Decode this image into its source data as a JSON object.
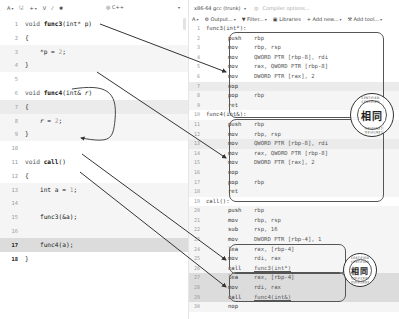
{
  "left_toolbar": {
    "items": [
      {
        "icon": "font-size-icon",
        "label": "A",
        "caret": "▾"
      },
      {
        "icon": "save-icon",
        "label": "🖫"
      },
      {
        "icon": "add-icon",
        "label": "+",
        "caret": "▾"
      },
      {
        "icon": "vim-icon",
        "label": "V"
      },
      {
        "icon": "pen-icon",
        "label": "⁄"
      },
      {
        "icon": "settings-icon",
        "label": "✱"
      }
    ],
    "language": {
      "icon": "cpp-logo-icon",
      "label": "C++",
      "caret": "▾"
    }
  },
  "source": {
    "lines": [
      {
        "n": "1",
        "text": "void func3(int* p)"
      },
      {
        "n": "2",
        "text": "{"
      },
      {
        "n": "3",
        "text": "    *p = 2;"
      },
      {
        "n": "4",
        "text": "}"
      },
      {
        "n": "5",
        "text": ""
      },
      {
        "n": "6",
        "text": "void func4(int& r)"
      },
      {
        "n": "7",
        "text": "{"
      },
      {
        "n": "8",
        "text": "    r = 2;"
      },
      {
        "n": "9",
        "text": "}"
      },
      {
        "n": "10",
        "text": ""
      },
      {
        "n": "11",
        "text": "void call()"
      },
      {
        "n": "12",
        "text": "{"
      },
      {
        "n": "13",
        "text": "    int a = 1;"
      },
      {
        "n": "14",
        "text": ""
      },
      {
        "n": "15",
        "text": "    func3(&a);"
      },
      {
        "n": "16",
        "text": ""
      },
      {
        "n": "17",
        "text": "    func4(a);"
      },
      {
        "n": "18",
        "text": "}"
      }
    ]
  },
  "compiler": {
    "name": "x86-64 gcc (trunk)",
    "caret": "▾",
    "options_placeholder": "Compiler options...",
    "toolbar": [
      {
        "icon": "font-size-icon",
        "label": "A",
        "caret": "▾"
      },
      {
        "icon": "gear-icon",
        "label": "⚙ Output...",
        "caret": "▾"
      },
      {
        "icon": "filter-icon",
        "label": "▼ Filter...",
        "caret": "▾"
      },
      {
        "icon": "book-icon",
        "label": "▣ Libraries"
      },
      {
        "icon": "plus-icon",
        "label": "+ Add new...",
        "caret": "▾"
      },
      {
        "icon": "wrench-icon",
        "label": "⚒ Add tool...",
        "caret": "▾"
      }
    ]
  },
  "assembly": {
    "lines": [
      {
        "n": "1",
        "label": "func3(int*):"
      },
      {
        "n": "2",
        "mnem": "push",
        "ops": "rbp"
      },
      {
        "n": "3",
        "mnem": "mov",
        "ops": "rbp, rsp"
      },
      {
        "n": "4",
        "mnem": "mov",
        "ops": "QWORD PTR [rbp-8], rdi"
      },
      {
        "n": "5",
        "mnem": "mov",
        "ops": "rax, QWORD PTR [rbp-8]"
      },
      {
        "n": "6",
        "mnem": "mov",
        "ops": "DWORD PTR [rax], 2"
      },
      {
        "n": "7",
        "mnem": "nop",
        "ops": ""
      },
      {
        "n": "8",
        "mnem": "pop",
        "ops": "rbp"
      },
      {
        "n": "9",
        "mnem": "ret",
        "ops": ""
      },
      {
        "n": "10",
        "label": "func4(int&):"
      },
      {
        "n": "11",
        "mnem": "push",
        "ops": "rbp"
      },
      {
        "n": "12",
        "mnem": "mov",
        "ops": "rbp, rsp"
      },
      {
        "n": "13",
        "mnem": "mov",
        "ops": "QWORD PTR [rbp-8], rdi"
      },
      {
        "n": "14",
        "mnem": "mov",
        "ops": "rax, QWORD PTR [rbp-8]"
      },
      {
        "n": "15",
        "mnem": "mov",
        "ops": "DWORD PTR [rax], 2"
      },
      {
        "n": "16",
        "mnem": "nop",
        "ops": ""
      },
      {
        "n": "17",
        "mnem": "pop",
        "ops": "rbp"
      },
      {
        "n": "18",
        "mnem": "ret",
        "ops": ""
      },
      {
        "n": "19",
        "label": "call():"
      },
      {
        "n": "20",
        "mnem": "push",
        "ops": "rbp"
      },
      {
        "n": "21",
        "mnem": "mov",
        "ops": "rbp, rsp"
      },
      {
        "n": "22",
        "mnem": "sub",
        "ops": "rsp, 16"
      },
      {
        "n": "23",
        "mnem": "mov",
        "ops": "DWORD PTR [rbp-4], 1"
      },
      {
        "n": "24",
        "mnem": "lea",
        "ops": "rax, [rbp-4]"
      },
      {
        "n": "25",
        "mnem": "mov",
        "ops": "rdi, rax"
      },
      {
        "n": "26",
        "mnem": "call",
        "ops": "func3(int*)"
      },
      {
        "n": "27",
        "mnem": "lea",
        "ops": "rax, [rbp-4]"
      },
      {
        "n": "28",
        "mnem": "mov",
        "ops": "rdi, rax"
      },
      {
        "n": "29",
        "mnem": "call",
        "ops": "func4(int&)"
      },
      {
        "n": "30",
        "mnem": "nop",
        "ops": ""
      }
    ]
  },
  "stamps": [
    {
      "text": "相同",
      "ring_top": "CERTIFIED CERTIFIED",
      "ring_bottom": "CERTIFIED CERTIFIED"
    },
    {
      "text": "相同",
      "ring_top": "CERTIFIED CERTIFIED",
      "ring_bottom": "CERTIFIED CERTIFIED"
    }
  ]
}
